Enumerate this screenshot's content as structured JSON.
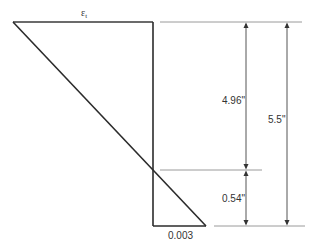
{
  "diagram": {
    "type": "strain-distribution",
    "colors": {
      "profile_line": "#2b2b2b",
      "dimension_line": "#555555",
      "extension_line": "#999999",
      "text": "#333333"
    },
    "labels": {
      "top_strain": {
        "symbol": "ε",
        "subscript": "t"
      },
      "bottom_strain": "0.003",
      "dim_upper": "4.96\"",
      "dim_lower": "0.54\"",
      "dim_total": "5.5\""
    }
  }
}
